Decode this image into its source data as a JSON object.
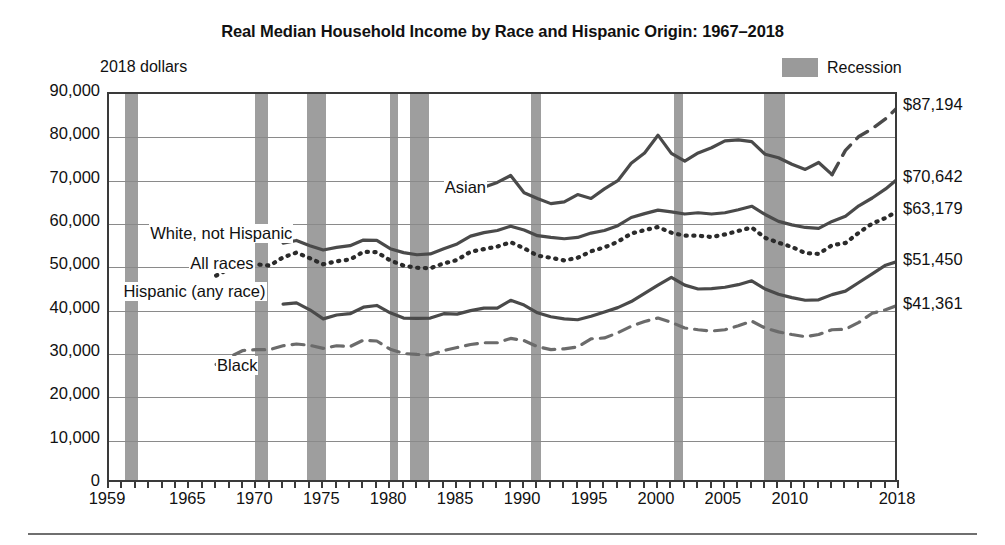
{
  "header": {
    "title": "Real Median Household Income by Race and Hispanic Origin: 1967–2018",
    "units_note": "2018 dollars"
  },
  "legend": {
    "recession_label": "Recession",
    "recession_color": "#9e9e9e"
  },
  "chart_data": {
    "type": "line",
    "title": "Real Median Household Income by Race and Hispanic Origin: 1967–2018",
    "xlabel": "",
    "ylabel": "2018 dollars",
    "xlim": [
      1959,
      2018
    ],
    "ylim": [
      0,
      90000
    ],
    "grid": true,
    "legend_position": "inline-annotations",
    "xticks": [
      1959,
      1965,
      1970,
      1975,
      1980,
      1985,
      1990,
      1995,
      2000,
      2005,
      2010,
      2018
    ],
    "xtick_labels": [
      "1959",
      "1965",
      "1970",
      "1975",
      "1980",
      "1985",
      "1990",
      "1995",
      "2000",
      "2005",
      "2010",
      "2018"
    ],
    "yticks": [
      0,
      10000,
      20000,
      30000,
      40000,
      50000,
      60000,
      70000,
      80000,
      90000
    ],
    "ytick_labels": [
      "0",
      "10,000",
      "20,000",
      "30,000",
      "40,000",
      "50,000",
      "60,000",
      "70,000",
      "80,000",
      "90,000"
    ],
    "end_labels": [
      {
        "series": "Asian",
        "value": 87194,
        "text": "$87,194"
      },
      {
        "series": "White, not Hispanic",
        "value": 70642,
        "text": "$70,642"
      },
      {
        "series": "All races",
        "value": 63179,
        "text": "$63,179"
      },
      {
        "series": "Hispanic (any race)",
        "value": 51450,
        "text": "$51,450"
      },
      {
        "series": "Black",
        "value": 41361,
        "text": "$41,361"
      }
    ],
    "annotations": [
      {
        "text": "Asian",
        "x": 1984,
        "y": 68000
      },
      {
        "text": "White, not Hispanic",
        "x": 1962,
        "y": 57500
      },
      {
        "text": "All races",
        "x": 1965,
        "y": 50500
      },
      {
        "text": "Hispanic (any race)",
        "x": 1960,
        "y": 44000
      },
      {
        "text": "Black",
        "x": 1967,
        "y": 27000
      }
    ],
    "recessions": [
      {
        "start": 1960.2,
        "end": 1961.2
      },
      {
        "start": 1969.9,
        "end": 1970.9
      },
      {
        "start": 1973.8,
        "end": 1975.2
      },
      {
        "start": 1980.0,
        "end": 1980.6
      },
      {
        "start": 1981.5,
        "end": 1982.9
      },
      {
        "start": 1990.5,
        "end": 1991.3
      },
      {
        "start": 2001.2,
        "end": 2001.9
      },
      {
        "start": 2007.9,
        "end": 2009.5
      }
    ],
    "series": [
      {
        "name": "White, not Hispanic",
        "style": "solid",
        "color": "#4a4a4a",
        "x": [
          1972,
          1973,
          1974,
          1975,
          1976,
          1977,
          1978,
          1979,
          1980,
          1981,
          1982,
          1983,
          1984,
          1985,
          1986,
          1987,
          1988,
          1989,
          1990,
          1991,
          1992,
          1993,
          1994,
          1995,
          1996,
          1997,
          1998,
          1999,
          2000,
          2001,
          2002,
          2003,
          2004,
          2005,
          2006,
          2007,
          2008,
          2009,
          2010,
          2011,
          2012,
          2013,
          2014,
          2015,
          2016,
          2017,
          2018
        ],
        "values": [
          55600,
          56200,
          55000,
          54000,
          54600,
          55000,
          56300,
          56200,
          54300,
          53400,
          52900,
          53100,
          54300,
          55400,
          57200,
          58000,
          58500,
          59500,
          58600,
          57300,
          56900,
          56600,
          56900,
          57900,
          58500,
          59600,
          61500,
          62400,
          63200,
          62800,
          62300,
          62600,
          62300,
          62600,
          63300,
          64100,
          62200,
          60600,
          59800,
          59200,
          59000,
          60600,
          61800,
          64200,
          66000,
          68100,
          70642
        ]
      },
      {
        "name": "All races",
        "style": "dotted",
        "color": "#2b2b2b",
        "x": [
          1967,
          1968,
          1969,
          1970,
          1971,
          1972,
          1973,
          1974,
          1975,
          1976,
          1977,
          1978,
          1979,
          1980,
          1981,
          1982,
          1983,
          1984,
          1985,
          1986,
          1987,
          1988,
          1989,
          1990,
          1991,
          1992,
          1993,
          1994,
          1995,
          1996,
          1997,
          1998,
          1999,
          2000,
          2001,
          2002,
          2003,
          2004,
          2005,
          2006,
          2007,
          2008,
          2009,
          2010,
          2011,
          2012,
          2013,
          2014,
          2015,
          2016,
          2017,
          2018
        ],
        "values": [
          48100,
          49700,
          51000,
          50700,
          50400,
          52300,
          53400,
          52100,
          50700,
          51400,
          51800,
          53600,
          53500,
          51600,
          50400,
          49900,
          49800,
          50900,
          51700,
          53600,
          54200,
          54800,
          55800,
          54400,
          52700,
          52200,
          51600,
          52200,
          53700,
          54600,
          55900,
          57800,
          58600,
          59300,
          58000,
          57300,
          57300,
          57000,
          57600,
          58400,
          59200,
          56800,
          55700,
          54700,
          53300,
          53100,
          55100,
          55600,
          58000,
          60100,
          61400,
          63179
        ]
      },
      {
        "name": "Hispanic (any race)",
        "style": "solid",
        "color": "#4a4a4a",
        "x": [
          1972,
          1973,
          1974,
          1975,
          1976,
          1977,
          1978,
          1979,
          1980,
          1981,
          1982,
          1983,
          1984,
          1985,
          1986,
          1987,
          1988,
          1989,
          1990,
          1991,
          1992,
          1993,
          1994,
          1995,
          1996,
          1997,
          1998,
          1999,
          2000,
          2001,
          2002,
          2003,
          2004,
          2005,
          2006,
          2007,
          2008,
          2009,
          2010,
          2011,
          2012,
          2013,
          2014,
          2015,
          2016,
          2017,
          2018
        ],
        "values": [
          41500,
          41800,
          40200,
          38100,
          39000,
          39300,
          40800,
          41200,
          39500,
          38300,
          38200,
          38300,
          39300,
          39200,
          40000,
          40600,
          40600,
          42400,
          41300,
          39500,
          38600,
          38100,
          37900,
          38700,
          39700,
          40700,
          42100,
          44000,
          45900,
          47700,
          45900,
          45000,
          45100,
          45400,
          46000,
          46900,
          45000,
          43800,
          43000,
          42400,
          42500,
          43700,
          44500,
          46500,
          48500,
          50500,
          51450
        ]
      },
      {
        "name": "Black",
        "style": "dashed",
        "color": "#6b6b6b",
        "x": [
          1967,
          1968,
          1969,
          1970,
          1971,
          1972,
          1973,
          1974,
          1975,
          1976,
          1977,
          1978,
          1979,
          1980,
          1981,
          1982,
          1983,
          1984,
          1985,
          1986,
          1987,
          1988,
          1989,
          1990,
          1991,
          1992,
          1993,
          1994,
          1995,
          1996,
          1997,
          1998,
          1999,
          2000,
          2001,
          2002,
          2003,
          2004,
          2005,
          2006,
          2007,
          2008,
          2009,
          2010,
          2011,
          2012,
          2013,
          2014,
          2015,
          2016,
          2017,
          2018
        ],
        "values": [
          27600,
          29300,
          30800,
          31000,
          31000,
          31900,
          32300,
          32000,
          31300,
          31900,
          31700,
          33200,
          33000,
          31100,
          30100,
          29900,
          29800,
          30800,
          31500,
          32200,
          32600,
          32600,
          33600,
          33100,
          31700,
          31000,
          31200,
          31600,
          33500,
          33700,
          34900,
          36400,
          37500,
          38300,
          37300,
          36000,
          35600,
          35300,
          35600,
          36500,
          37600,
          36000,
          35100,
          34500,
          34000,
          34500,
          35600,
          35700,
          37300,
          39400,
          40200,
          41361
        ]
      },
      {
        "name": "Asian",
        "style": "solid-then-dashed",
        "color": "#4a4a4a",
        "x": [
          1987,
          1988,
          1989,
          1990,
          1991,
          1992,
          1993,
          1994,
          1995,
          1996,
          1997,
          1998,
          1999,
          2000,
          2001,
          2002,
          2003,
          2004,
          2005,
          2006,
          2007,
          2008,
          2009,
          2010,
          2011,
          2012,
          2013,
          2014,
          2015,
          2016,
          2017,
          2018
        ],
        "values": [
          68500,
          69600,
          71200,
          67200,
          65900,
          64700,
          65100,
          66800,
          65900,
          68100,
          70000,
          74000,
          76400,
          80500,
          76300,
          74500,
          76400,
          77600,
          79200,
          79400,
          79000,
          76100,
          75300,
          73800,
          72600,
          74200,
          71400,
          77000,
          80200,
          82000,
          84300,
          87194
        ],
        "dash_from": 2013
      }
    ]
  }
}
